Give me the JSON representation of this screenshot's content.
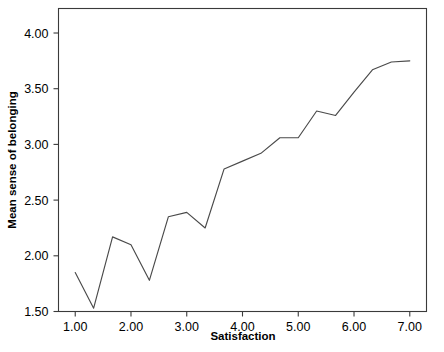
{
  "chart_data": {
    "type": "line",
    "title": "",
    "xlabel": "Satisfaction",
    "ylabel": "Mean sense of belonging",
    "xlim": [
      0.7,
      7.3
    ],
    "ylim": [
      1.5,
      4.22
    ],
    "xticks": [
      1.0,
      2.0,
      3.0,
      4.0,
      5.0,
      6.0,
      7.0
    ],
    "xticklabels": [
      "1.00",
      "2.00",
      "3.00",
      "4.00",
      "5.00",
      "6.00",
      "7.00"
    ],
    "yticks": [
      1.5,
      2.0,
      2.5,
      3.0,
      3.5,
      4.0
    ],
    "yticklabels": [
      "1.50",
      "2.00",
      "2.50",
      "3.00",
      "3.50",
      "4.00"
    ],
    "grid": false,
    "legend": null,
    "line_color": "#4a4a4a",
    "series": [
      {
        "name": "Mean sense of belonging",
        "x": [
          1.0,
          1.33,
          1.67,
          2.0,
          2.33,
          2.67,
          3.0,
          3.33,
          3.67,
          4.0,
          4.33,
          4.67,
          5.0,
          5.33,
          5.67,
          6.0,
          6.33,
          6.67,
          7.0
        ],
        "y": [
          1.85,
          1.53,
          2.17,
          2.1,
          1.78,
          2.35,
          2.39,
          2.25,
          2.78,
          2.85,
          2.92,
          3.06,
          3.06,
          3.3,
          3.26,
          3.47,
          3.67,
          3.74,
          3.75
        ]
      }
    ]
  },
  "axes": {
    "x_title": "Satisfaction",
    "y_title": "Mean sense of belonging"
  }
}
